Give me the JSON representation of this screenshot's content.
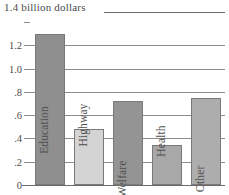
{
  "chart_data": {
    "type": "bar",
    "title": "1.4 billion dollars",
    "xlabel": "",
    "ylabel": "billion dollars",
    "categories": [
      "Education",
      "Highway",
      "Welfare",
      "Health",
      "Other"
    ],
    "values": [
      1.3,
      0.48,
      0.72,
      0.34,
      0.75
    ],
    "series": [
      {
        "name": "Spending",
        "values": [
          1.3,
          0.48,
          0.72,
          0.34,
          0.75
        ]
      }
    ],
    "bar_colors": [
      "#8f8f8f",
      "#d4d4d4",
      "#949494",
      "#a8a8a8",
      "#adadad"
    ],
    "ylim": [
      0,
      1.4
    ],
    "ytick_labels": [
      "1.4",
      "1.2",
      "1.0",
      ".8",
      ".6",
      ".4",
      ".2",
      "0"
    ],
    "ytick_values": [
      1.4,
      1.2,
      1.0,
      0.8,
      0.6,
      0.4,
      0.2,
      0
    ],
    "grid": true,
    "legend": "none",
    "grid_color": "#8d8d8d",
    "axis_color": "#6a6a6a",
    "text_color": "#4a4a4a"
  },
  "caption": {
    "text": "1.4 billion dollars"
  }
}
